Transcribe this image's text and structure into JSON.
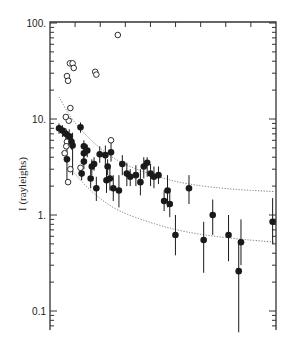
{
  "chart_data": {
    "type": "scatter",
    "title": "",
    "xlabel": "",
    "ylabel": "I (rayleighs)",
    "yscale": "log",
    "ylim": [
      0.05,
      100
    ],
    "xlim": [
      0,
      1
    ],
    "yticks": [
      {
        "value": 100,
        "label": "100."
      },
      {
        "value": 10,
        "label": "10."
      },
      {
        "value": 1,
        "label": "1."
      },
      {
        "value": 0.1,
        "label": "0.1"
      }
    ],
    "x_major_ticks": 9,
    "x_tick_labels": [],
    "grid": false,
    "legend": null,
    "series": [
      {
        "name": "open circles",
        "marker": "open-circle",
        "points": [
          {
            "x": 0.088,
            "y": 38
          },
          {
            "x": 0.1,
            "y": 38
          },
          {
            "x": 0.105,
            "y": 34
          },
          {
            "x": 0.075,
            "y": 28
          },
          {
            "x": 0.08,
            "y": 25
          },
          {
            "x": 0.2,
            "y": 31
          },
          {
            "x": 0.205,
            "y": 29
          },
          {
            "x": 0.3,
            "y": 75
          },
          {
            "x": 0.09,
            "y": 13
          },
          {
            "x": 0.083,
            "y": 9.6
          },
          {
            "x": 0.07,
            "y": 10.5
          },
          {
            "x": 0.062,
            "y": 7.4
          },
          {
            "x": 0.075,
            "y": 5.8
          },
          {
            "x": 0.072,
            "y": 5.2
          },
          {
            "x": 0.065,
            "y": 4.4
          },
          {
            "x": 0.09,
            "y": 3.0
          },
          {
            "x": 0.135,
            "y": 3.1
          },
          {
            "x": 0.27,
            "y": 6.0
          },
          {
            "x": 0.08,
            "y": 2.2
          }
        ]
      },
      {
        "name": "filled circles with error bars",
        "marker": "filled-circle",
        "points": [
          {
            "x": 0.04,
            "y": 8.0,
            "lo": 7.0,
            "hi": 9.0
          },
          {
            "x": 0.055,
            "y": 7.6,
            "lo": 6.5,
            "hi": 8.6
          },
          {
            "x": 0.07,
            "y": 7.0,
            "lo": 6.0,
            "hi": 8.0
          },
          {
            "x": 0.085,
            "y": 6.6,
            "lo": 5.5,
            "hi": 7.8
          },
          {
            "x": 0.095,
            "y": 5.8,
            "lo": 4.8,
            "hi": 7.0
          },
          {
            "x": 0.075,
            "y": 3.8,
            "lo": 2.2,
            "hi": 6.8
          },
          {
            "x": 0.1,
            "y": 5.3,
            "lo": 2.6,
            "hi": 7.2
          },
          {
            "x": 0.135,
            "y": 8.2,
            "lo": 7.2,
            "hi": 9.2
          },
          {
            "x": 0.15,
            "y": 5.2,
            "lo": 4.5,
            "hi": 6.0
          },
          {
            "x": 0.15,
            "y": 4.4,
            "lo": 3.8,
            "hi": 5.0
          },
          {
            "x": 0.15,
            "y": 3.6,
            "lo": 3.0,
            "hi": 4.4
          },
          {
            "x": 0.14,
            "y": 2.7,
            "lo": 2.3,
            "hi": 3.2
          },
          {
            "x": 0.165,
            "y": 4.7,
            "lo": 4.0,
            "hi": 5.4
          },
          {
            "x": 0.185,
            "y": 3.2,
            "lo": 2.6,
            "hi": 3.8
          },
          {
            "x": 0.195,
            "y": 3.4,
            "lo": 2.9,
            "hi": 4.0
          },
          {
            "x": 0.22,
            "y": 4.3,
            "lo": 3.5,
            "hi": 5.2
          },
          {
            "x": 0.245,
            "y": 4.2,
            "lo": 3.4,
            "hi": 5.3
          },
          {
            "x": 0.255,
            "y": 3.2,
            "lo": 2.6,
            "hi": 3.8
          },
          {
            "x": 0.27,
            "y": 4.5,
            "lo": 3.6,
            "hi": 6.0
          },
          {
            "x": 0.18,
            "y": 2.4,
            "lo": 1.9,
            "hi": 3.0
          },
          {
            "x": 0.205,
            "y": 1.9,
            "lo": 1.4,
            "hi": 2.5
          },
          {
            "x": 0.25,
            "y": 2.3,
            "lo": 1.7,
            "hi": 3.0
          },
          {
            "x": 0.265,
            "y": 2.4,
            "lo": 1.8,
            "hi": 3.2
          },
          {
            "x": 0.28,
            "y": 1.9,
            "lo": 1.4,
            "hi": 2.6
          },
          {
            "x": 0.305,
            "y": 1.8,
            "lo": 1.2,
            "hi": 2.6
          },
          {
            "x": 0.32,
            "y": 3.4,
            "lo": 2.6,
            "hi": 4.2
          },
          {
            "x": 0.34,
            "y": 2.7,
            "lo": 2.0,
            "hi": 3.5
          },
          {
            "x": 0.355,
            "y": 2.5,
            "lo": 2.0,
            "hi": 3.0
          },
          {
            "x": 0.38,
            "y": 2.6,
            "lo": 2.0,
            "hi": 3.3
          },
          {
            "x": 0.4,
            "y": 2.2,
            "lo": 1.6,
            "hi": 3.0
          },
          {
            "x": 0.415,
            "y": 3.2,
            "lo": 2.4,
            "hi": 4.0
          },
          {
            "x": 0.43,
            "y": 3.5,
            "lo": 2.5,
            "hi": 4.0
          },
          {
            "x": 0.445,
            "y": 2.7,
            "lo": 2.0,
            "hi": 3.4
          },
          {
            "x": 0.46,
            "y": 2.5,
            "lo": 1.9,
            "hi": 3.2
          },
          {
            "x": 0.48,
            "y": 2.6,
            "lo": 2.1,
            "hi": 3.2
          },
          {
            "x": 0.505,
            "y": 1.4,
            "lo": 1.1,
            "hi": 1.8
          },
          {
            "x": 0.52,
            "y": 1.8,
            "lo": 1.2,
            "hi": 2.6
          },
          {
            "x": 0.53,
            "y": 1.3,
            "lo": 0.95,
            "hi": 1.9
          },
          {
            "x": 0.555,
            "y": 0.62,
            "lo": 0.38,
            "hi": 1.0
          },
          {
            "x": 0.615,
            "y": 1.9,
            "lo": 1.3,
            "hi": 2.6
          },
          {
            "x": 0.68,
            "y": 0.55,
            "lo": 0.25,
            "hi": 0.85
          },
          {
            "x": 0.72,
            "y": 1.0,
            "lo": 0.62,
            "hi": 1.45
          },
          {
            "x": 0.79,
            "y": 0.62,
            "lo": 0.33,
            "hi": 1.0
          },
          {
            "x": 0.845,
            "y": 0.52,
            "lo": 0.3,
            "hi": 0.9
          },
          {
            "x": 0.835,
            "y": 0.26,
            "lo": 0.06,
            "hi": 0.55
          },
          {
            "x": 0.985,
            "y": 0.85,
            "lo": 0.5,
            "hi": 1.5
          }
        ]
      }
    ],
    "curves": [
      {
        "name": "upper dotted curve",
        "style": "dotted",
        "points": [
          [
            0.04,
            17
          ],
          [
            0.1,
            9.5
          ],
          [
            0.2,
            5.4
          ],
          [
            0.3,
            3.6
          ],
          [
            0.45,
            2.6
          ],
          [
            0.6,
            2.1
          ],
          [
            0.8,
            1.85
          ],
          [
            1.0,
            1.75
          ]
        ]
      },
      {
        "name": "lower dotted curve",
        "style": "dotted",
        "points": [
          [
            0.05,
            4.5
          ],
          [
            0.1,
            2.8
          ],
          [
            0.2,
            1.6
          ],
          [
            0.3,
            1.1
          ],
          [
            0.45,
            0.82
          ],
          [
            0.6,
            0.66
          ],
          [
            0.8,
            0.57
          ],
          [
            1.0,
            0.52
          ]
        ]
      }
    ]
  },
  "plot_box": {
    "left": 50,
    "right": 276,
    "top": 22,
    "bottom": 330
  },
  "colors": {
    "ink": "#1a1a1a",
    "axis": "#333333",
    "curve": "#777777",
    "background": "#ffffff"
  }
}
